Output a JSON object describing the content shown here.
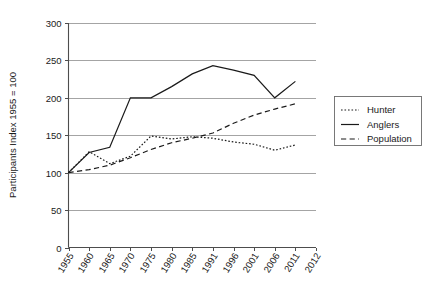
{
  "chart_data": {
    "type": "line",
    "title": "",
    "xlabel": "",
    "ylabel": "Participants Index 1955 = 100",
    "categories": [
      "1955",
      "1960",
      "1965",
      "1970",
      "1975",
      "1980",
      "1985",
      "1991",
      "1996",
      "2001",
      "2006",
      "2011",
      "2012"
    ],
    "ylim": [
      0,
      300
    ],
    "yticks": [
      0,
      50,
      100,
      150,
      200,
      250,
      300
    ],
    "ytick_labels": [
      "0",
      "50",
      "100",
      "150",
      "200",
      "250",
      "300"
    ],
    "grid": true,
    "legend_position": "right",
    "series": [
      {
        "name": "Hunter",
        "style": "dotted",
        "color": "#1a1a1a",
        "values": [
          100,
          128,
          112,
          122,
          149,
          145,
          148,
          146,
          141,
          138,
          130,
          137,
          null
        ]
      },
      {
        "name": "Anglers",
        "style": "solid",
        "color": "#1a1a1a",
        "values": [
          100,
          127,
          134,
          200,
          200,
          215,
          232,
          243,
          237,
          230,
          200,
          222,
          null
        ]
      },
      {
        "name": "Population",
        "style": "dashed",
        "color": "#1a1a1a",
        "values": [
          100,
          104,
          110,
          120,
          131,
          140,
          146,
          153,
          166,
          177,
          185,
          192,
          null
        ]
      }
    ]
  },
  "legend": {
    "items": [
      {
        "label": "Hunter"
      },
      {
        "label": "Anglers"
      },
      {
        "label": "Population"
      }
    ]
  }
}
